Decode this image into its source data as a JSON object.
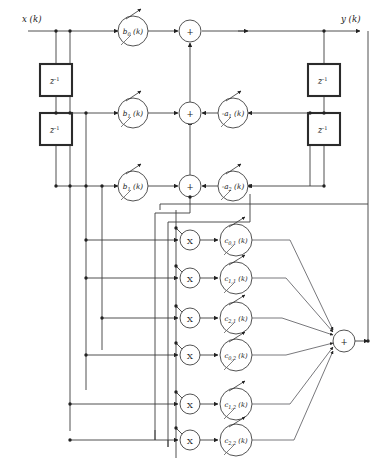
{
  "diagram": {
    "input_label": "x (k)",
    "output_label": "y (k)",
    "delay_label_base": "z",
    "delay_label_exp": "-1",
    "multiplier_symbol": "X",
    "summer_symbol": "+",
    "colors": {
      "background": "#ffffff",
      "wire": "#3c3c3c",
      "node_stroke": "#4a4a4a",
      "delay_stroke": "#2b2b2b",
      "text": "#1a1a1a",
      "dot": "#222222"
    },
    "feedforward_gains": [
      {
        "id": "b0",
        "base": "b",
        "sub": "0",
        "arg": "(k)",
        "label": "b0 (k)"
      },
      {
        "id": "b1",
        "base": "b",
        "sub": "1",
        "arg": "(k)",
        "label": "b1 (k)"
      },
      {
        "id": "b2",
        "base": "b",
        "sub": "1",
        "arg": "(k)",
        "label": "b1 (k)"
      }
    ],
    "feedback_gains": [
      {
        "id": "a1",
        "base": "-a",
        "sub": "1",
        "arg": "(k)",
        "label": "-a1 (k)"
      },
      {
        "id": "a2",
        "base": "-a",
        "sub": "2",
        "arg": "(k)",
        "label": "-a2 (k)"
      }
    ],
    "cross_gains": [
      {
        "id": "c01",
        "base": "c",
        "sub": "0,1",
        "arg": "(k)",
        "label": "c0,1 (k)"
      },
      {
        "id": "c11",
        "base": "c",
        "sub": "1,1",
        "arg": "(k)",
        "label": "c1,1 (k)"
      },
      {
        "id": "c21",
        "base": "c",
        "sub": "2,1",
        "arg": "(k)",
        "label": "c2,1 (k)"
      },
      {
        "id": "c02",
        "base": "c",
        "sub": "0,2",
        "arg": "(k)",
        "label": "c0,2 (k)"
      },
      {
        "id": "c12",
        "base": "c",
        "sub": "1,2",
        "arg": "(k)",
        "label": "c1,2 (k)"
      },
      {
        "id": "c22",
        "base": "c",
        "sub": "2,2",
        "arg": "(k)",
        "label": "c2,2 (k)"
      }
    ],
    "delays": [
      {
        "id": "input-delay-1",
        "side": "input"
      },
      {
        "id": "input-delay-2",
        "side": "input"
      },
      {
        "id": "output-delay-1",
        "side": "output"
      },
      {
        "id": "output-delay-2",
        "side": "output"
      }
    ],
    "summers": [
      {
        "id": "sum-top"
      },
      {
        "id": "sum-mid"
      },
      {
        "id": "sum-bottom"
      },
      {
        "id": "sum-output"
      }
    ]
  }
}
